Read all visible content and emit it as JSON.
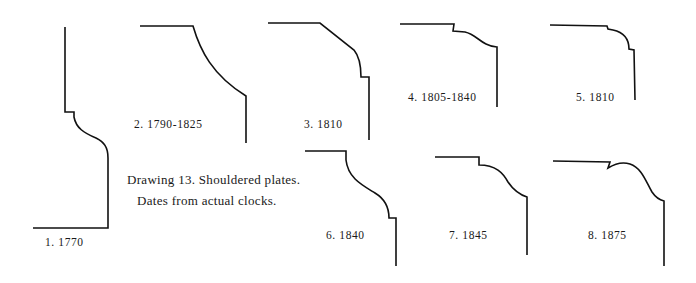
{
  "figure": {
    "caption": {
      "line1": "Drawing 13. Shouldered plates.",
      "line2": "Dates from actual clocks."
    },
    "profiles": [
      {
        "id": 1,
        "label": "1. 1770"
      },
      {
        "id": 2,
        "label": "2. 1790-1825"
      },
      {
        "id": 3,
        "label": "3. 1810"
      },
      {
        "id": 4,
        "label": "4. 1805-1840"
      },
      {
        "id": 5,
        "label": "5. 1810"
      },
      {
        "id": 6,
        "label": "6. 1840"
      },
      {
        "id": 7,
        "label": "7. 1845"
      },
      {
        "id": 8,
        "label": "8. 1875"
      }
    ],
    "colors": {
      "line": "#111111",
      "text": "#1a1a1a",
      "background": "#ffffff"
    }
  }
}
